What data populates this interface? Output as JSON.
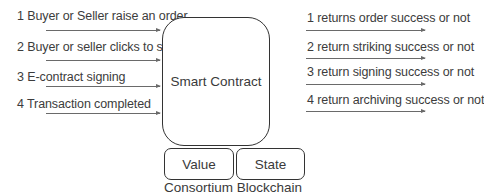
{
  "diagram": {
    "center": {
      "label": "Smart Contract"
    },
    "inputs": [
      {
        "label": "1 Buyer or Seller raise an order"
      },
      {
        "label": "2 Buyer or seller clicks to strike"
      },
      {
        "label": "3 E-contract signing"
      },
      {
        "label": "4 Transaction completed"
      }
    ],
    "outputs": [
      {
        "label": "1 returns order success or not"
      },
      {
        "label": "2 return striking success or not"
      },
      {
        "label": "3 return signing success or not"
      },
      {
        "label": "4 return archiving success or not"
      }
    ],
    "storage": [
      {
        "label": "Value"
      },
      {
        "label": "State"
      }
    ],
    "footer": "Consortium Blockchain",
    "colors": {
      "stroke": "#333333",
      "arrow": "#6a6a6a",
      "text": "#3a3a3a"
    }
  }
}
